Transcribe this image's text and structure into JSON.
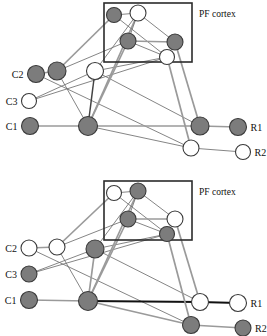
{
  "figure": {
    "title": "",
    "panels": [
      {
        "id": "panel-top",
        "box_label": "PF cortex",
        "input_labels": [
          "C2",
          "C3",
          "C1"
        ],
        "output_labels": [
          "R1",
          "R2"
        ],
        "nodes": [
          {
            "id": "c2",
            "label": "C2",
            "x": 36,
            "y": 74,
            "r": 8.5,
            "fill": "dark",
            "group": "input"
          },
          {
            "id": "c3",
            "label": "C3",
            "x": 29,
            "y": 101,
            "r": 7.5,
            "fill": "light",
            "group": "input"
          },
          {
            "id": "c1",
            "label": "C1",
            "x": 30,
            "y": 126,
            "r": 8.5,
            "fill": "dark",
            "group": "input"
          },
          {
            "id": "h1",
            "label": "",
            "x": 57,
            "y": 71,
            "r": 9.0,
            "fill": "dark",
            "group": "hidden"
          },
          {
            "id": "h2",
            "label": "",
            "x": 95,
            "y": 71,
            "r": 8.5,
            "fill": "light",
            "group": "hidden"
          },
          {
            "id": "h3",
            "label": "",
            "x": 88,
            "y": 126,
            "r": 9.5,
            "fill": "dark",
            "group": "hidden"
          },
          {
            "id": "p1",
            "label": "",
            "x": 114,
            "y": 15,
            "r": 7.5,
            "fill": "dark",
            "group": "pf"
          },
          {
            "id": "p2",
            "label": "",
            "x": 138,
            "y": 13,
            "r": 8.0,
            "fill": "light",
            "group": "pf"
          },
          {
            "id": "p3",
            "label": "",
            "x": 128,
            "y": 41,
            "r": 8.0,
            "fill": "dark",
            "group": "pf"
          },
          {
            "id": "p4",
            "label": "",
            "x": 175,
            "y": 42,
            "r": 8.0,
            "fill": "dark",
            "group": "pf"
          },
          {
            "id": "p5",
            "label": "",
            "x": 167,
            "y": 57,
            "r": 7.5,
            "fill": "light",
            "group": "pf"
          },
          {
            "id": "o1",
            "label": "",
            "x": 200,
            "y": 126,
            "r": 9.0,
            "fill": "dark",
            "group": "hidden"
          },
          {
            "id": "o2",
            "label": "",
            "x": 191,
            "y": 148,
            "r": 8.0,
            "fill": "light",
            "group": "hidden"
          },
          {
            "id": "r1",
            "label": "R1",
            "x": 238,
            "y": 127,
            "r": 8.5,
            "fill": "dark",
            "group": "output"
          },
          {
            "id": "r2",
            "label": "R2",
            "x": 243,
            "y": 152,
            "r": 7.5,
            "fill": "light",
            "group": "output"
          }
        ],
        "edges": [
          {
            "from": "c2",
            "to": "h1",
            "style": "gray"
          },
          {
            "from": "c1",
            "to": "h3",
            "style": "gray"
          },
          {
            "from": "c3",
            "to": "h2",
            "style": "thin"
          },
          {
            "from": "c2",
            "to": "o2",
            "style": "thin"
          },
          {
            "from": "c3",
            "to": "p5",
            "style": "thin"
          },
          {
            "from": "h1",
            "to": "p1",
            "style": "gray"
          },
          {
            "from": "h1",
            "to": "h3",
            "style": "thin"
          },
          {
            "from": "h1",
            "to": "p3",
            "style": "thin"
          },
          {
            "from": "h2",
            "to": "h3",
            "style": "dark"
          },
          {
            "from": "h2",
            "to": "p2",
            "style": "thin"
          },
          {
            "from": "h2",
            "to": "p5",
            "style": "thin"
          },
          {
            "from": "h2",
            "to": "o1",
            "style": "thin"
          },
          {
            "from": "h3",
            "to": "p2",
            "style": "gray"
          },
          {
            "from": "h3",
            "to": "p3",
            "style": "gray"
          },
          {
            "from": "h3",
            "to": "o1",
            "style": "gray"
          },
          {
            "from": "h3",
            "to": "o2",
            "style": "thin"
          },
          {
            "from": "p1",
            "to": "p2",
            "style": "thin"
          },
          {
            "from": "p1",
            "to": "p5",
            "style": "thin"
          },
          {
            "from": "p2",
            "to": "p3",
            "style": "thin"
          },
          {
            "from": "p2",
            "to": "p4",
            "style": "thin"
          },
          {
            "from": "p3",
            "to": "p4",
            "style": "gray"
          },
          {
            "from": "p3",
            "to": "p5",
            "style": "thin"
          },
          {
            "from": "p4",
            "to": "o1",
            "style": "gray"
          },
          {
            "from": "p5",
            "to": "o2",
            "style": "gray"
          },
          {
            "from": "o1",
            "to": "r1",
            "style": "gray"
          },
          {
            "from": "o2",
            "to": "r2",
            "style": "thin"
          }
        ],
        "box": {
          "x": 104,
          "y": 3,
          "w": 88,
          "h": 59
        }
      },
      {
        "id": "panel-bottom",
        "box_label": "PF cortex",
        "input_labels": [
          "C2",
          "C3",
          "C1"
        ],
        "output_labels": [
          "R1",
          "R2"
        ],
        "nodes": [
          {
            "id": "c2",
            "label": "C2",
            "x": 29,
            "y": 80,
            "r": 8.0,
            "fill": "light",
            "group": "input"
          },
          {
            "id": "c3",
            "label": "C3",
            "x": 29,
            "y": 106,
            "r": 8.0,
            "fill": "dark",
            "group": "input"
          },
          {
            "id": "c1",
            "label": "C1",
            "x": 29,
            "y": 132,
            "r": 8.5,
            "fill": "dark",
            "group": "input"
          },
          {
            "id": "h1",
            "label": "",
            "x": 57,
            "y": 79,
            "r": 8.0,
            "fill": "light",
            "group": "hidden"
          },
          {
            "id": "h2",
            "label": "",
            "x": 95,
            "y": 81,
            "r": 9.0,
            "fill": "dark",
            "group": "hidden"
          },
          {
            "id": "h3",
            "label": "",
            "x": 88,
            "y": 133,
            "r": 9.5,
            "fill": "dark",
            "group": "hidden"
          },
          {
            "id": "p1",
            "label": "",
            "x": 114,
            "y": 25,
            "r": 7.5,
            "fill": "light",
            "group": "pf"
          },
          {
            "id": "p2",
            "label": "",
            "x": 138,
            "y": 23,
            "r": 8.0,
            "fill": "dark",
            "group": "pf"
          },
          {
            "id": "p3",
            "label": "",
            "x": 128,
            "y": 51,
            "r": 8.0,
            "fill": "dark",
            "group": "pf"
          },
          {
            "id": "p4",
            "label": "",
            "x": 175,
            "y": 51,
            "r": 8.0,
            "fill": "light",
            "group": "pf"
          },
          {
            "id": "p5",
            "label": "",
            "x": 167,
            "y": 66,
            "r": 7.5,
            "fill": "dark",
            "group": "pf"
          },
          {
            "id": "o1",
            "label": "",
            "x": 200,
            "y": 134,
            "r": 8.5,
            "fill": "light",
            "group": "hidden"
          },
          {
            "id": "o2",
            "label": "",
            "x": 191,
            "y": 157,
            "r": 8.5,
            "fill": "dark",
            "group": "hidden"
          },
          {
            "id": "r1",
            "label": "R1",
            "x": 238,
            "y": 135,
            "r": 8.5,
            "fill": "light",
            "group": "output"
          },
          {
            "id": "r2",
            "label": "R2",
            "x": 243,
            "y": 160,
            "r": 8.0,
            "fill": "dark",
            "group": "output"
          }
        ],
        "edges": [
          {
            "from": "c2",
            "to": "h1",
            "style": "gray"
          },
          {
            "from": "c1",
            "to": "h3",
            "style": "gray"
          },
          {
            "from": "c3",
            "to": "h2",
            "style": "thin"
          },
          {
            "from": "c2",
            "to": "o2",
            "style": "thin"
          },
          {
            "from": "c3",
            "to": "p5",
            "style": "thin"
          },
          {
            "from": "h1",
            "to": "p1",
            "style": "gray"
          },
          {
            "from": "h1",
            "to": "h3",
            "style": "thin"
          },
          {
            "from": "h1",
            "to": "p3",
            "style": "thin"
          },
          {
            "from": "h2",
            "to": "h3",
            "style": "gray"
          },
          {
            "from": "h2",
            "to": "p2",
            "style": "thin"
          },
          {
            "from": "h2",
            "to": "p5",
            "style": "thin"
          },
          {
            "from": "h2",
            "to": "o1",
            "style": "thin"
          },
          {
            "from": "h3",
            "to": "p2",
            "style": "gray"
          },
          {
            "from": "h3",
            "to": "p3",
            "style": "gray"
          },
          {
            "from": "h3",
            "to": "o1",
            "style": "black"
          },
          {
            "from": "h3",
            "to": "o2",
            "style": "gray"
          },
          {
            "from": "p1",
            "to": "p2",
            "style": "thin"
          },
          {
            "from": "p1",
            "to": "p5",
            "style": "thin"
          },
          {
            "from": "p2",
            "to": "p3",
            "style": "thin"
          },
          {
            "from": "p2",
            "to": "p4",
            "style": "thin"
          },
          {
            "from": "p3",
            "to": "p4",
            "style": "gray"
          },
          {
            "from": "p3",
            "to": "p5",
            "style": "thin"
          },
          {
            "from": "p4",
            "to": "o1",
            "style": "gray"
          },
          {
            "from": "p5",
            "to": "o2",
            "style": "gray"
          },
          {
            "from": "o1",
            "to": "r1",
            "style": "black"
          },
          {
            "from": "o2",
            "to": "r2",
            "style": "gray"
          }
        ],
        "box": {
          "x": 104,
          "y": 13,
          "w": 88,
          "h": 59
        }
      }
    ],
    "colors": {
      "node_dark": "#7c7c7c",
      "node_light": "#ffffff",
      "node_stroke": "#3a3a3a",
      "edge_gray": "#9a9a9a",
      "edge_thin": "#6f6f6f",
      "edge_black": "#111111",
      "box_stroke": "#2b2b2b",
      "background": "#ffffff"
    }
  }
}
